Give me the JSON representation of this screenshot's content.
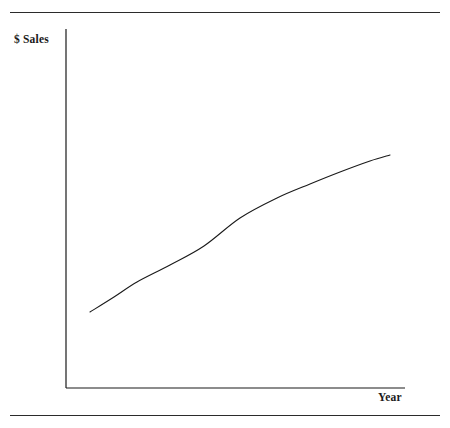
{
  "figure": {
    "background_color": "#ffffff",
    "ink_color": "#1a1a1a",
    "rules": {
      "top_label": "top-divider-rule",
      "bottom_label": "bottom-divider-rule"
    }
  },
  "chart_data": {
    "type": "line",
    "title": "",
    "subtitle": "",
    "xlabel": "Year",
    "ylabel": "$ Sales",
    "grid": false,
    "legend": null,
    "legend_position": "none",
    "axes": {
      "x_tick_labels": [],
      "y_tick_labels": [],
      "x_axis_line": true,
      "y_axis_line": true,
      "xlim": [
        0,
        1
      ],
      "ylim": [
        0,
        1
      ],
      "x_axis_pixel_y": 388,
      "y_axis_pixel_x": 66,
      "plot_left": 66,
      "plot_right": 405,
      "plot_top": 29,
      "plot_bottom": 388
    },
    "series": [
      {
        "name": "Sales",
        "color": "#1a1a1a",
        "line_width": 1.1,
        "shape": "concave-down increasing curve (diminishing growth)",
        "x": [
          0.07,
          0.14,
          0.21,
          0.31,
          0.41,
          0.51,
          0.62,
          0.72,
          0.82,
          0.91,
          0.96
        ],
        "y": [
          0.21,
          0.27,
          0.33,
          0.41,
          0.48,
          0.54,
          0.6,
          0.64,
          0.67,
          0.69,
          0.7
        ],
        "points_pixels": [
          [
            90,
            312
          ],
          [
            114,
            297
          ],
          [
            137,
            282
          ],
          [
            170,
            265
          ],
          [
            204,
            246
          ],
          [
            240,
            218
          ],
          [
            277,
            198
          ],
          [
            310,
            184
          ],
          [
            340,
            172
          ],
          [
            370,
            161
          ],
          [
            390,
            155
          ]
        ]
      }
    ],
    "annotations": []
  },
  "labels": {
    "y_axis_title": "$ Sales",
    "x_axis_title": "Year"
  }
}
